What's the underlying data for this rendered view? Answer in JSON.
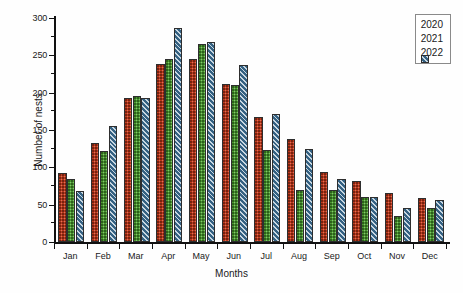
{
  "chart_data": {
    "type": "bar",
    "title": "",
    "xlabel": "Months",
    "ylabel": "Number of nests",
    "categories": [
      "Jan",
      "Feb",
      "Mar",
      "Apr",
      "May",
      "Jun",
      "Jul",
      "Aug",
      "Sep",
      "Oct",
      "Nov",
      "Dec"
    ],
    "ylim": [
      0,
      300
    ],
    "ytick_labels": [
      "0",
      "50",
      "100",
      "150",
      "200",
      "250",
      "300"
    ],
    "ytick_values": [
      0,
      50,
      100,
      150,
      200,
      250,
      300
    ],
    "yminor_step": 25,
    "grid": false,
    "legend_position": "top-right",
    "series": [
      {
        "name": "2020",
        "color": "#c0391b",
        "values": [
          92,
          133,
          193,
          238,
          245,
          212,
          167,
          138,
          94,
          82,
          65,
          59
        ]
      },
      {
        "name": "2021",
        "color": "#4a9b2f",
        "values": [
          84,
          122,
          195,
          245,
          265,
          210,
          123,
          70,
          69,
          60,
          35,
          45
        ]
      },
      {
        "name": "2022",
        "color": "#3b6e94",
        "values": [
          68,
          155,
          193,
          287,
          268,
          237,
          172,
          125,
          84,
          60,
          46,
          56
        ]
      }
    ]
  },
  "legend": {
    "items": [
      {
        "label": "2020"
      },
      {
        "label": "2021"
      },
      {
        "label": "2022"
      }
    ]
  }
}
